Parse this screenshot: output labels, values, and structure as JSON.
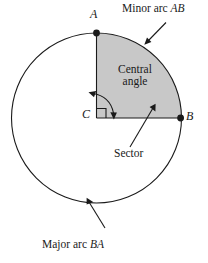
{
  "figure": {
    "type": "circle-geometry-diagram",
    "colors": {
      "stroke": "#1a1a1a",
      "sector_fill": "#c8c8c8",
      "background": "#ffffff",
      "text": "#1a1a1a"
    },
    "circle": {
      "center_x": 96.5,
      "center_y": 118,
      "radius": 85
    }
  },
  "points": [
    {
      "id": "A",
      "label": "A",
      "x": 96.5,
      "y": 33,
      "label_x": 90,
      "label_y": 10
    },
    {
      "id": "B",
      "label": "B",
      "x": 181.5,
      "y": 118,
      "label_x": 186,
      "label_y": 112
    },
    {
      "id": "C",
      "label": "C",
      "x": 96.5,
      "y": 118,
      "label_x": 82,
      "label_y": 110
    }
  ],
  "callouts": {
    "minor_arc": {
      "text": "Minor arc ",
      "italic": "AB",
      "x": 122,
      "y": 3
    },
    "central_angle": {
      "line1": "Central",
      "line2": "angle",
      "x": 108,
      "y": 64
    },
    "sector": {
      "text": "Sector",
      "x": 115,
      "y": 148
    },
    "major_arc": {
      "text": "Major arc ",
      "italic": "BA",
      "x": 42,
      "y": 240
    }
  },
  "markers": {
    "right_angle": "right-angle-square",
    "central_angle_arc": "double-headed-curved-arrow"
  }
}
